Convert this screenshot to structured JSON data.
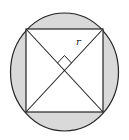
{
  "diagram": {
    "labels": {
      "radius": "r"
    },
    "colors": {
      "shading": "#d9d9d9",
      "stroke": "#222222",
      "square_fill": "#ffffff"
    },
    "geometry": {
      "circle": {
        "cx": 64.5,
        "cy": 72,
        "rx": 54,
        "ry": 59
      },
      "square": {
        "x1": 26,
        "y1": 29,
        "x2": 103,
        "y2": 112
      },
      "center": {
        "x": 64.5,
        "y": 70.5
      },
      "right_angle_marker": true
    }
  }
}
